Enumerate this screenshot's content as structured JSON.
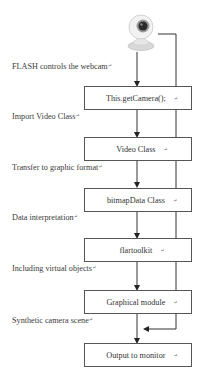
{
  "diagram": {
    "source_icon": "webcam-icon",
    "steps": [
      {
        "label": "FLASH controls the webcam",
        "box": "This.getCamera();"
      },
      {
        "label": "Import Video Class",
        "box": "Video Class"
      },
      {
        "label": "Transfer to graphic format",
        "box": "bitmapData Class"
      },
      {
        "label": "Data interpretation",
        "box": "flartoolkit"
      },
      {
        "label": "Including virtual objects",
        "box": "Graphical module"
      },
      {
        "label": "Synthetic camera scene",
        "box": "Output to monitor"
      }
    ],
    "paragraph_mark": "↵",
    "bypass_edge": {
      "from": "webcam",
      "to": "Output to monitor",
      "note": "camera feed merged into synthetic scene"
    },
    "colors": {
      "line": "#333333",
      "box_border": "#555555",
      "text": "#333333"
    }
  }
}
